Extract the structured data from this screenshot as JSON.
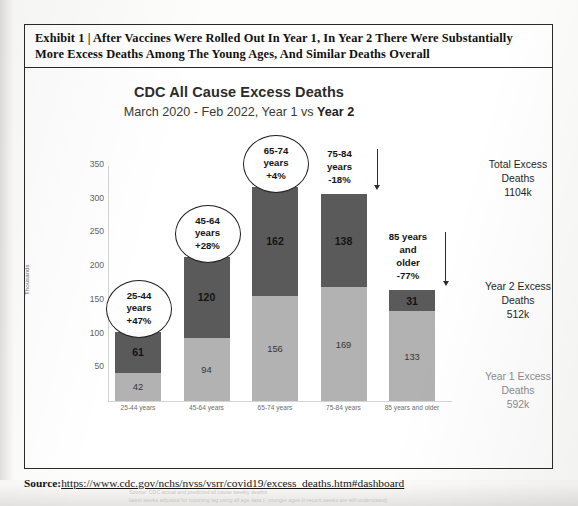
{
  "exhibit": {
    "title": "Exhibit 1 | After Vaccines Were Rolled Out In Year 1, In Year 2 There Were Substantially More Excess Deaths Among The Young Ages, And Similar Deaths Overall"
  },
  "chart_header": {
    "title": "CDC All Cause Excess Deaths",
    "subtitle_prefix": "March 2020 - Feb 2022, Year 1 vs ",
    "subtitle_bold": "Year 2"
  },
  "chart_data": {
    "type": "bar",
    "stacked": true,
    "title": "CDC All Cause Excess Deaths",
    "subtitle": "March 2020 - Feb 2022, Year 1 vs Year 2",
    "xlabel": "",
    "ylabel": "Thousands",
    "ylim": [
      0,
      350
    ],
    "yticks": [
      50,
      100,
      150,
      200,
      250,
      300,
      350
    ],
    "grid": false,
    "legend": "none",
    "categories": [
      "25-44 years",
      "45-64 years",
      "65-74 years",
      "75-84 years",
      "85 years and older"
    ],
    "series": [
      {
        "name": "Year 1",
        "color": "#b2b2b2",
        "values": [
          42,
          94,
          156,
          169,
          133
        ]
      },
      {
        "name": "Year 2",
        "color": "#5a5a5a",
        "values": [
          61,
          120,
          162,
          138,
          31
        ]
      }
    ],
    "totals": [
      103,
      214,
      318,
      307,
      164
    ],
    "annotations": [
      {
        "age": "25-44",
        "line1": "25-44",
        "line2": "years",
        "change": "+47%",
        "style": "ellipse",
        "arrow": "none"
      },
      {
        "age": "45-64",
        "line1": "45-64",
        "line2": "years",
        "change": "+28%",
        "style": "ellipse",
        "arrow": "none"
      },
      {
        "age": "65-74",
        "line1": "65-74",
        "line2": "years",
        "change": "+4%",
        "style": "ellipse",
        "arrow": "none"
      },
      {
        "age": "75-84",
        "line1": "75-84",
        "line2": "years",
        "change": "-18%",
        "style": "plain",
        "arrow": "down"
      },
      {
        "age": "85+",
        "line1": "85 years",
        "line2": "and",
        "line3": "older",
        "change": "-77%",
        "style": "plain",
        "arrow": "down"
      }
    ]
  },
  "side_notes": [
    {
      "line1": "Total Excess",
      "line2": "Deaths",
      "value": "1104k",
      "tone": "dark"
    },
    {
      "line1": "Year 2 Excess",
      "line2": "Deaths",
      "value": "512k",
      "tone": "dark"
    },
    {
      "line1": "Year 1 Excess",
      "line2": "Deaths",
      "value": "592k",
      "tone": "light"
    }
  ],
  "chart_footnote": {
    "line1": "Source: CDC actual and predicted all cause weekly deaths",
    "line2": "latest weeks adjusted for reporting lag using all age data (- younger ages in recent weeks are still understated)"
  },
  "source": {
    "label": "Source:",
    "url": "https://www.cdc.gov/nchs/nvss/vsrr/covid19/excess_deaths.htm#dashboard"
  }
}
